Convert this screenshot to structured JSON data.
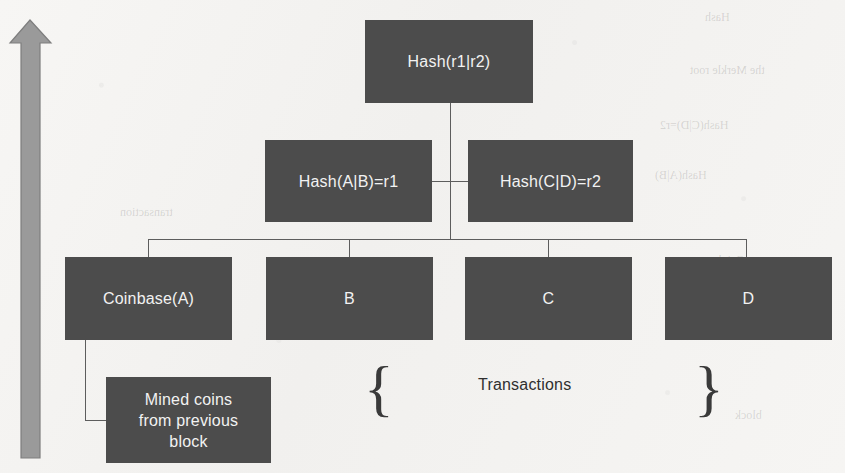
{
  "figure": {
    "background_color": "#f4f3f1",
    "node_color": "#4c4c4c",
    "node_text_color": "#f2f2f2",
    "connector_color": "#5d5d5d",
    "arrow_color": "#9a9a9a",
    "caption_color": "#2f2f2f"
  },
  "arrow": {
    "name": "time-direction-arrow",
    "direction": "up"
  },
  "nodes": {
    "root": {
      "label": "Hash(r1|r2)"
    },
    "level2": [
      {
        "label": "Hash(A|B)=r1"
      },
      {
        "label": "Hash(C|D)=r2"
      }
    ],
    "leaves": [
      {
        "label": "Coinbase(A)"
      },
      {
        "label": "B"
      },
      {
        "label": "C"
      },
      {
        "label": "D"
      }
    ],
    "side_note": {
      "line1": "Mined coins",
      "line2": "from previous",
      "line3": "block"
    }
  },
  "annotations": {
    "transactions_label": "Transactions",
    "brace_left": "{",
    "brace_right": "}"
  },
  "ghost_text": [
    "Hash",
    "Hash(A|B)",
    "Hash(C|D)=r2",
    "transaction",
    "the Merkle root",
    "block",
    "Coinbase",
    "B",
    "C"
  ]
}
